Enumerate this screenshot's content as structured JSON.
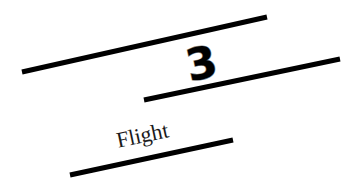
{
  "scene": {
    "background_color": "#ffffff",
    "line_color": "#000000",
    "numeral": "3",
    "numeral_outline_color": "#8a8a8a",
    "label": "Flight",
    "label_color": "#1a1a1a"
  }
}
